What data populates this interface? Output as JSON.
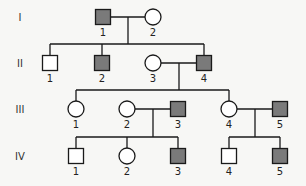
{
  "colors": {
    "affected": "#7a7a7a",
    "unaffected": "#ffffff",
    "line": "#1a1a1a",
    "background": "#f7f7f5"
  },
  "generations": [
    {
      "label": "I",
      "y": 17
    },
    {
      "label": "II",
      "y": 63
    },
    {
      "label": "III",
      "y": 109
    },
    {
      "label": "IV",
      "y": 156
    }
  ],
  "individuals": [
    {
      "id": "I-1",
      "gen": 0,
      "num": "1",
      "sex": "male",
      "affected": true,
      "x": 103
    },
    {
      "id": "I-2",
      "gen": 0,
      "num": "2",
      "sex": "female",
      "affected": false,
      "x": 153
    },
    {
      "id": "II-1",
      "gen": 1,
      "num": "1",
      "sex": "male",
      "affected": false,
      "x": 50
    },
    {
      "id": "II-2",
      "gen": 1,
      "num": "2",
      "sex": "male",
      "affected": true,
      "x": 102
    },
    {
      "id": "II-3",
      "gen": 1,
      "num": "3",
      "sex": "female",
      "affected": false,
      "x": 153
    },
    {
      "id": "II-4",
      "gen": 1,
      "num": "4",
      "sex": "male",
      "affected": true,
      "x": 204
    },
    {
      "id": "III-1",
      "gen": 2,
      "num": "1",
      "sex": "female",
      "affected": false,
      "x": 76
    },
    {
      "id": "III-2",
      "gen": 2,
      "num": "2",
      "sex": "female",
      "affected": false,
      "x": 127
    },
    {
      "id": "III-3",
      "gen": 2,
      "num": "3",
      "sex": "male",
      "affected": true,
      "x": 178
    },
    {
      "id": "III-4",
      "gen": 2,
      "num": "4",
      "sex": "female",
      "affected": false,
      "x": 229
    },
    {
      "id": "III-5",
      "gen": 2,
      "num": "5",
      "sex": "male",
      "affected": true,
      "x": 280
    },
    {
      "id": "IV-1",
      "gen": 3,
      "num": "1",
      "sex": "male",
      "affected": false,
      "x": 76
    },
    {
      "id": "IV-2",
      "gen": 3,
      "num": "2",
      "sex": "female",
      "affected": false,
      "x": 127
    },
    {
      "id": "IV-3",
      "gen": 3,
      "num": "3",
      "sex": "male",
      "affected": true,
      "x": 178
    },
    {
      "id": "IV-4",
      "gen": 3,
      "num": "4",
      "sex": "male",
      "affected": false,
      "x": 229
    },
    {
      "id": "IV-5",
      "gen": 3,
      "num": "5",
      "sex": "male",
      "affected": true,
      "x": 280
    }
  ],
  "matings": [
    {
      "a": "I-1",
      "b": "I-2",
      "dropX": 128,
      "children": [
        "II-1",
        "II-2",
        "II-4"
      ]
    },
    {
      "a": "II-3",
      "b": "II-4",
      "dropX": 179,
      "children": [
        "III-1",
        "III-4"
      ]
    },
    {
      "a": "III-2",
      "b": "III-3",
      "dropX": 153,
      "children": [
        "IV-1",
        "IV-2",
        "IV-3"
      ]
    },
    {
      "a": "III-4",
      "b": "III-5",
      "dropX": 255,
      "children": [
        "IV-4",
        "IV-5"
      ]
    }
  ]
}
